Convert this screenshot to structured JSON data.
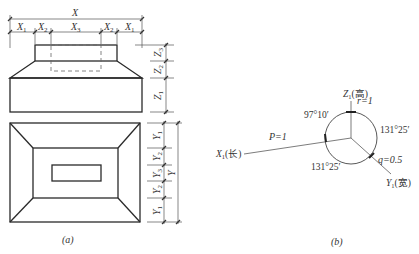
{
  "panel_a": {
    "caption": "(a)",
    "top_dims": {
      "total": "X",
      "segments": [
        "X1",
        "X2",
        "X3",
        "X2",
        "X1"
      ]
    },
    "top_dim_labels": {
      "total": "X",
      "x1": "X",
      "x1_sub": "1",
      "x2": "X",
      "x2_sub": "2",
      "x3": "X",
      "x3_sub": "3"
    },
    "side_dims_elevation": {
      "segments": [
        "Z3",
        "Z2",
        "Z1"
      ]
    },
    "z_labels": {
      "z": "Z",
      "z1_sub": "1",
      "z2_sub": "2",
      "z3_sub": "3"
    },
    "side_dims_plan": {
      "total": "Y",
      "segments": [
        "Y1",
        "Y2",
        "Y3",
        "Y2",
        "Y1"
      ]
    },
    "y_labels": {
      "total": "Y",
      "y": "Y",
      "y1_sub": "1",
      "y2_sub": "2",
      "y3_sub": "3"
    }
  },
  "panel_b": {
    "caption": "(b)",
    "axes": {
      "z": {
        "label": "Z",
        "sub": "1",
        "suffix": "(高)"
      },
      "x": {
        "label": "X",
        "sub": "1",
        "suffix": "(长)"
      },
      "y": {
        "label": "Y",
        "sub": "1",
        "suffix": "(宽)"
      }
    },
    "coefficients": {
      "r": "r=1",
      "p": "P=1",
      "q": "q=0.5"
    },
    "angles": {
      "zx": "97°10′",
      "zy": "131°25′",
      "xy": "131°25′"
    }
  }
}
